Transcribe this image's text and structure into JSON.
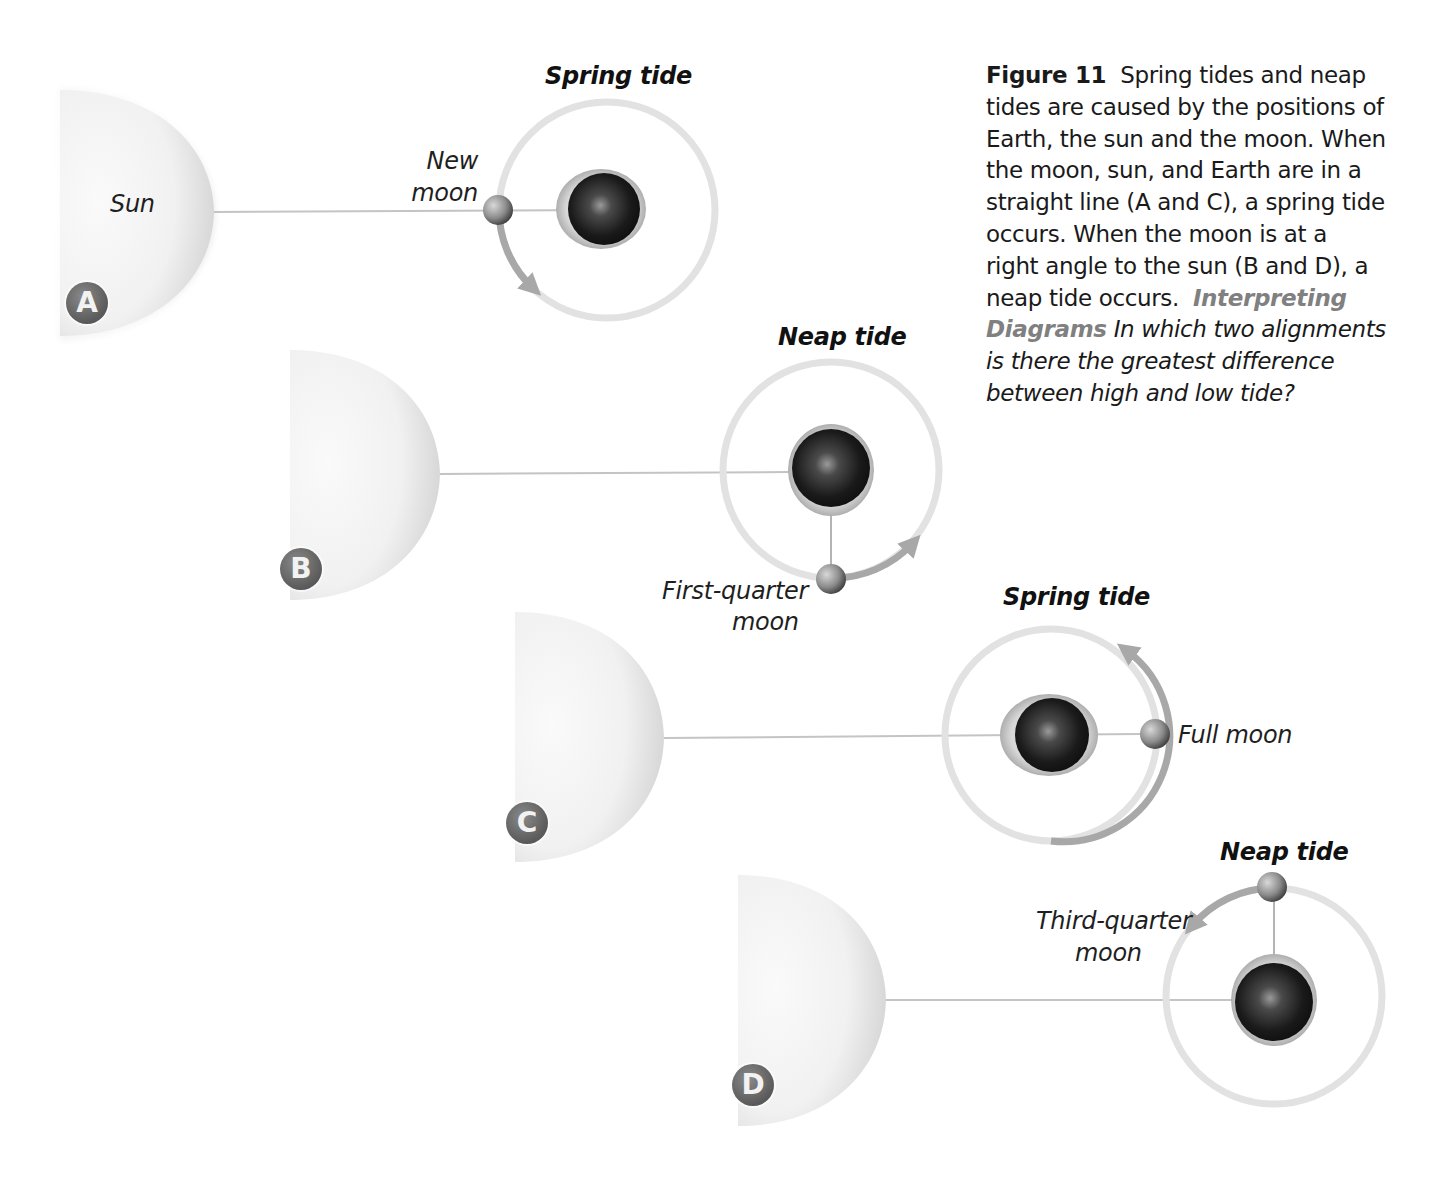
{
  "caption": {
    "figure_label": "Figure 11",
    "body": "Spring tides and neap tides are caused by the positions of Earth, the sun and the moon. When the moon, sun, and Earth are in a straight line (A and C), a spring tide occurs. When the moon is at a right angle to the sun (B and D), a neap tide occurs.",
    "interpreting_label": "Interpreting Diagrams",
    "question": "In which two alignments is there the greatest difference between high and low tide?"
  },
  "panels": [
    {
      "id": "A",
      "title": "Spring tide",
      "sun_label": "Sun",
      "moon_label_line1": "New",
      "moon_label_line2": "moon",
      "moon_phase": "new-moon"
    },
    {
      "id": "B",
      "title": "Neap tide",
      "moon_label_line1": "First-quarter",
      "moon_label_line2": "moon",
      "moon_phase": "first-quarter-moon"
    },
    {
      "id": "C",
      "title": "Spring tide",
      "moon_label_line1": "Full moon",
      "moon_phase": "full-moon"
    },
    {
      "id": "D",
      "title": "Neap tide",
      "moon_label_line1": "Third-quarter",
      "moon_label_line2": "moon",
      "moon_phase": "third-quarter-moon"
    }
  ],
  "colors": {
    "sun_light": "#f7f7f7",
    "sun_shade": "#bdbdbd",
    "orbit": "#dcdcdc",
    "orbit_arrow": "#a8a8a8",
    "earth_dark": "#141414",
    "badge": "#5e5e5e",
    "interpreting_accent": "#808080"
  }
}
